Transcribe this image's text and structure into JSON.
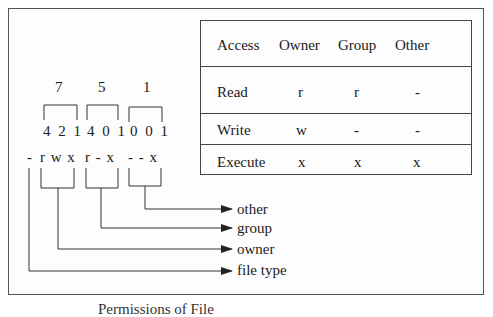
{
  "diagram": {
    "octal_digits": [
      "7",
      "5",
      "1"
    ],
    "bit_groups": [
      "4 2 1",
      "4 0 1",
      "0 0 1"
    ],
    "permission_string": {
      "file_type": "-",
      "owner": "r w x",
      "group": "r - x",
      "other": "- - x"
    },
    "arrow_labels": {
      "other": "other",
      "group": "group",
      "owner": "owner",
      "file_type": "file type"
    },
    "caption": "Permissions of File"
  },
  "table": {
    "headers": [
      "Access",
      "Owner",
      "Group",
      "Other"
    ],
    "rows": [
      {
        "access": "Read",
        "owner": "r",
        "group": "r",
        "other": "-"
      },
      {
        "access": "Write",
        "owner": "w",
        "group": "-",
        "other": "-"
      },
      {
        "access": "Execute",
        "owner": "x",
        "group": "x",
        "other": "x"
      }
    ]
  },
  "colors": {
    "line": "#333333",
    "frame": "#555555",
    "text": "#1a1a1a",
    "background": "#ffffff"
  }
}
